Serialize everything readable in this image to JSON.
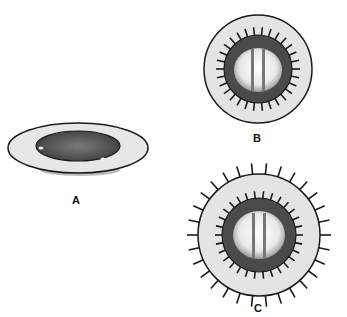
{
  "figures": [
    {
      "id": "A",
      "label": "A",
      "view": "side-oblique",
      "description": "valve with sewing ring, oblique view"
    },
    {
      "id": "B",
      "label": "B",
      "view": "top",
      "description": "valve with sutures through inner ring"
    },
    {
      "id": "C",
      "label": "C",
      "view": "top",
      "description": "valve with sutures through inner and outer rings"
    }
  ],
  "colors": {
    "ring": "#e4e4e4",
    "outline": "#1a1a1a",
    "valve_dark": "#4a4a4a",
    "orifice": "#f2f2f2"
  }
}
